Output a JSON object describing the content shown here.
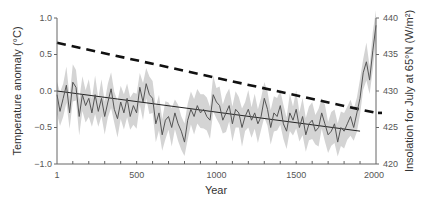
{
  "chart_data": {
    "type": "line",
    "title": "",
    "xlabel": "Year",
    "ylabel": "Temperature anomaly (°C)",
    "ylabel_right": "Insolation for July at 65°N (W/m²)",
    "xlim": [
      1,
      2000
    ],
    "ylim": [
      -1.0,
      1.0
    ],
    "ylim_right": [
      420,
      440
    ],
    "x_ticks": [
      "1",
      "500",
      "1000",
      "1500",
      "2000"
    ],
    "y_ticks": [
      "1.0",
      "0.5",
      "0.0",
      "−0.5",
      "−1.0"
    ],
    "y_ticks_right": [
      "440",
      "435",
      "430",
      "425",
      "420"
    ],
    "grid": false,
    "legend": null,
    "series": [
      {
        "name": "Temperature reconstruction (decadal)",
        "style": "thin solid dark gray line",
        "x": [
          1,
          20,
          40,
          60,
          80,
          100,
          120,
          140,
          160,
          180,
          200,
          220,
          240,
          260,
          280,
          300,
          320,
          340,
          360,
          380,
          400,
          420,
          440,
          460,
          480,
          500,
          520,
          540,
          560,
          580,
          600,
          620,
          640,
          660,
          680,
          700,
          720,
          740,
          760,
          780,
          800,
          820,
          840,
          860,
          880,
          900,
          920,
          940,
          960,
          980,
          1000,
          1020,
          1040,
          1060,
          1080,
          1100,
          1120,
          1140,
          1160,
          1180,
          1200,
          1220,
          1240,
          1260,
          1280,
          1300,
          1320,
          1340,
          1360,
          1380,
          1400,
          1420,
          1440,
          1460,
          1480,
          1500,
          1520,
          1540,
          1560,
          1580,
          1600,
          1620,
          1640,
          1660,
          1680,
          1700,
          1720,
          1740,
          1760,
          1780,
          1800,
          1820,
          1840,
          1860,
          1880,
          1900,
          1920,
          1940,
          1960,
          1980,
          2000
        ],
        "values": [
          -0.05,
          -0.28,
          -0.1,
          0.08,
          -0.3,
          0.12,
          0.05,
          -0.35,
          -0.05,
          -0.2,
          -0.1,
          -0.3,
          -0.05,
          -0.28,
          -0.1,
          -0.35,
          -0.15,
          0.03,
          -0.25,
          -0.38,
          -0.15,
          -0.3,
          -0.1,
          -0.35,
          -0.2,
          -0.3,
          0.05,
          -0.15,
          0.1,
          -0.05,
          -0.1,
          -0.45,
          -0.3,
          -0.6,
          -0.4,
          -0.35,
          -0.5,
          -0.3,
          -0.45,
          -0.55,
          -0.7,
          -0.4,
          -0.25,
          -0.35,
          -0.2,
          -0.3,
          -0.25,
          -0.35,
          -0.4,
          -0.05,
          -0.15,
          -0.2,
          -0.4,
          -0.3,
          -0.2,
          -0.45,
          -0.25,
          -0.3,
          -0.5,
          -0.35,
          -0.25,
          -0.4,
          -0.3,
          -0.45,
          -0.35,
          -0.1,
          -0.25,
          -0.5,
          -0.3,
          -0.35,
          -0.2,
          -0.45,
          -0.55,
          -0.3,
          -0.4,
          -0.25,
          -0.5,
          -0.35,
          -0.6,
          -0.45,
          -0.4,
          -0.55,
          -0.5,
          -0.3,
          -0.45,
          -0.6,
          -0.55,
          -0.45,
          -0.7,
          -0.5,
          -0.55,
          -0.45,
          -0.35,
          -0.5,
          -0.3,
          -0.1,
          0.25,
          0.4,
          0.15,
          0.55,
          0.9
        ]
      },
      {
        "name": "Uncertainty band",
        "style": "light gray shaded area",
        "half_width": 0.22
      },
      {
        "name": "Linear cooling trend (1–1900)",
        "style": "thin solid black line",
        "x": [
          1,
          1900
        ],
        "values": [
          0.0,
          -0.55
        ]
      },
      {
        "name": "Insolation for July at 65°N",
        "axis": "right",
        "style": "thick black dashed line",
        "x": [
          1,
          2000
        ],
        "values": [
          436.6,
          427.0
        ]
      }
    ]
  }
}
